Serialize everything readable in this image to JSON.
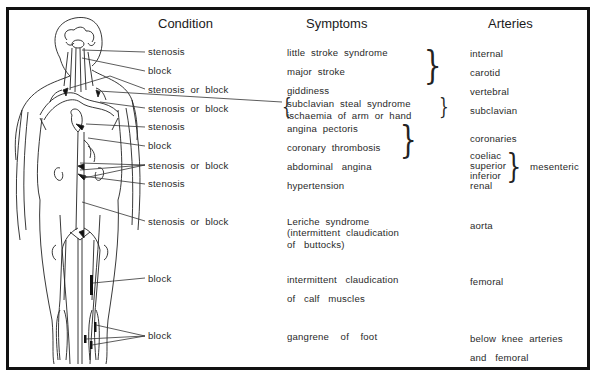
{
  "headers": {
    "condition": "Condition",
    "symptoms": "Symptoms",
    "arteries": "Arteries"
  },
  "conditions": [
    "stenosis",
    "block",
    "stenosis  or  block",
    "stenosis  or  block",
    "stenosis",
    "block",
    "stenosis  or  block",
    "stenosis",
    "stenosis  or  block",
    "block",
    "block"
  ],
  "symptoms": {
    "little_stroke": "little  stroke  syndrome",
    "major_stroke": "major  stroke",
    "giddiness": "giddiness",
    "subclavian_steal": "subclavian  steal  syndrome",
    "ischaemia_arm": "ischaemia  of  arm  or  hand",
    "angina_pectoris": "angina  pectoris",
    "coronary_thrombosis": "coronary  thrombosis",
    "abdominal_angina": "abdominal   angina",
    "hypertension": "hypertension",
    "leriche_1": "Leriche  syndrome",
    "leriche_2": "(intermittent  claudication",
    "leriche_3": "of   buttocks)",
    "claudication_1": "intermittent   claudication",
    "claudication_2": "of   calf   muscles",
    "gangrene": "gangrene    of    foot"
  },
  "arteries": {
    "internal": "internal",
    "carotid": "carotid",
    "vertebral": "vertebral",
    "subclavian": "subclavian",
    "coronaries": "coronaries",
    "coeliac": "coeliac",
    "superior": "superior",
    "inferior": "inferior",
    "mesenteric": "mesenteric",
    "renal": "renal",
    "aorta": "aorta",
    "femoral": "femoral",
    "below_knee_1": "below  knee  arteries",
    "below_knee_2": "and   femoral"
  },
  "braces": {
    "right": "}",
    "left": "{"
  }
}
